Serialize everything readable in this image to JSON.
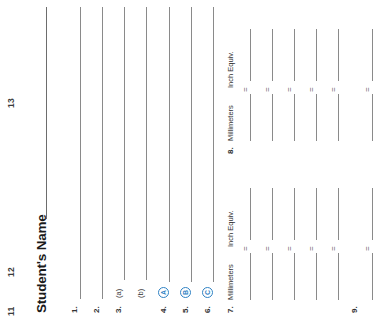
{
  "document": {
    "title": "Student's Name",
    "edge_page_numbers": [
      "11",
      "12",
      "13"
    ]
  },
  "questions": [
    {
      "number": "1.",
      "sub": "",
      "choice": ""
    },
    {
      "number": "2.",
      "sub": "",
      "choice": ""
    },
    {
      "number": "3.",
      "sub": "(a)",
      "choice": ""
    },
    {
      "number": "",
      "sub": "(b)",
      "choice": ""
    },
    {
      "number": "4.",
      "sub": "",
      "choice": "A"
    },
    {
      "number": "5.",
      "sub": "",
      "choice": "B"
    },
    {
      "number": "6.",
      "sub": "",
      "choice": "C"
    }
  ],
  "conversion_tables": [
    {
      "number": "7.",
      "col_millimeters": "Millimeters",
      "col_inch_equiv": "Inch Equiv.",
      "equals": "=",
      "row_count": 5
    },
    {
      "number": "8.",
      "col_millimeters": "Millimeters",
      "col_inch_equiv": "Inch Equiv.",
      "equals": "=",
      "row_count": 5
    }
  ],
  "final_item": {
    "number": "9.",
    "equals": "="
  },
  "colors": {
    "choice_blue": "#2f82c4",
    "rule_gray": "#8a8a8a",
    "text_dark": "#231f20",
    "paper": "#ffffff"
  }
}
